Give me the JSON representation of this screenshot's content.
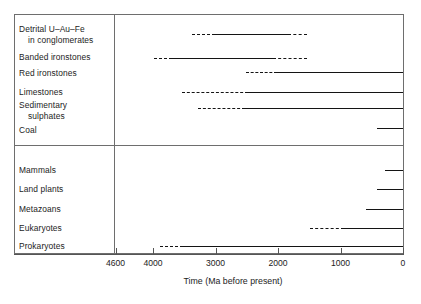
{
  "chart_data": {
    "type": "bar",
    "title": "",
    "xlabel": "Time (Ma before present)",
    "ylabel": "",
    "xlim": [
      4800,
      0
    ],
    "xticks": [
      4600,
      4000,
      3000,
      2000,
      1000,
      0
    ],
    "xtick_labels": [
      "4600",
      "4000",
      "3000",
      "2000",
      "1000",
      "0"
    ],
    "grid": false,
    "legend": null,
    "orientation": "horizontal-range-bars",
    "note": "Geological / biological first-appearance ranges. Dashed = uncertain or intermittent occurrence, solid = continuous record.",
    "groups": [
      {
        "name": "geological-deposits",
        "categories": [
          {
            "label_lines": [
              "Detrital U–Au–Fe",
              "in conglomerates"
            ],
            "label": "Detrital U–Au–Fe in conglomerates",
            "segments": [
              {
                "style": "dashed",
                "from_ma": 3380,
                "to_ma": 3010
              },
              {
                "style": "solid",
                "from_ma": 3010,
                "to_ma": 1840
              },
              {
                "style": "dashed",
                "from_ma": 1840,
                "to_ma": 1540
              }
            ]
          },
          {
            "label_lines": [
              "Banded ironstones"
            ],
            "label": "Banded ironstones",
            "segments": [
              {
                "style": "dashed",
                "from_ma": 3980,
                "to_ma": 3700
              },
              {
                "style": "solid",
                "from_ma": 3700,
                "to_ma": 2080
              },
              {
                "style": "dashed",
                "from_ma": 2080,
                "to_ma": 1540
              }
            ]
          },
          {
            "label_lines": [
              "Red ironstones"
            ],
            "label": "Red ironstones",
            "segments": [
              {
                "style": "dashed",
                "from_ma": 2510,
                "to_ma": 2020
              },
              {
                "style": "solid",
                "from_ma": 2020,
                "to_ma": 0
              }
            ]
          },
          {
            "label_lines": [
              "Limestones"
            ],
            "label": "Limestones",
            "segments": [
              {
                "style": "dashed",
                "from_ma": 3540,
                "to_ma": 2480
              },
              {
                "style": "solid",
                "from_ma": 2480,
                "to_ma": 0
              }
            ]
          },
          {
            "label_lines": [
              "Sedimentary",
              "sulphates"
            ],
            "label": "Sedimentary sulphates",
            "segments": [
              {
                "style": "dashed",
                "from_ma": 3280,
                "to_ma": 2530
              },
              {
                "style": "solid",
                "from_ma": 2530,
                "to_ma": 0
              }
            ]
          },
          {
            "label_lines": [
              "Coal"
            ],
            "label": "Coal",
            "segments": [
              {
                "style": "solid",
                "from_ma": 420,
                "to_ma": 0
              }
            ]
          }
        ]
      },
      {
        "name": "life-forms",
        "categories": [
          {
            "label_lines": [
              "Mammals"
            ],
            "label": "Mammals",
            "segments": [
              {
                "style": "solid",
                "from_ma": 290,
                "to_ma": 0
              }
            ]
          },
          {
            "label_lines": [
              "Land plants"
            ],
            "label": "Land plants",
            "segments": [
              {
                "style": "solid",
                "from_ma": 420,
                "to_ma": 0
              }
            ]
          },
          {
            "label_lines": [
              "Metazoans"
            ],
            "label": "Metazoans",
            "segments": [
              {
                "style": "solid",
                "from_ma": 590,
                "to_ma": 0
              }
            ]
          },
          {
            "label_lines": [
              "Eukaryotes"
            ],
            "label": "Eukaryotes",
            "segments": [
              {
                "style": "dashed",
                "from_ma": 1490,
                "to_ma": 945
              },
              {
                "style": "solid",
                "from_ma": 945,
                "to_ma": 0
              }
            ]
          },
          {
            "label_lines": [
              "Prokaryotes"
            ],
            "label": "Prokaryotes",
            "segments": [
              {
                "style": "dashed",
                "from_ma": 3890,
                "to_ma": 3520
              },
              {
                "style": "solid",
                "from_ma": 3520,
                "to_ma": 0
              }
            ]
          }
        ]
      }
    ]
  },
  "labels": {
    "row_texts": [
      "Detrital U–Au–Fe",
      "in conglomerates",
      "Banded ironstones",
      "Red ironstones",
      "Limestones",
      "Sedimentary",
      "sulphates",
      "Coal",
      "Mammals",
      "Land plants",
      "Metazoans",
      "Eukaryotes",
      "Prokaryotes"
    ]
  },
  "colors": {
    "bar": "#141414",
    "frame": "#6e6e6e",
    "text": "#1c1c1c",
    "background": "#ffffff"
  }
}
